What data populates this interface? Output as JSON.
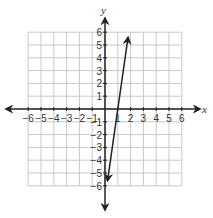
{
  "chart_data": {
    "type": "line",
    "title": "",
    "xlabel": "x",
    "ylabel": "y",
    "xlim": [
      -6,
      6
    ],
    "ylim": [
      -6,
      6
    ],
    "grid": true,
    "x_ticks": [
      "-6",
      "-5",
      "-4",
      "-3",
      "-2",
      "-1",
      "1",
      "2",
      "3",
      "4",
      "5",
      "6"
    ],
    "y_ticks": [
      "6",
      "5",
      "4",
      "3",
      "2",
      "1",
      "-1",
      "-2",
      "-3",
      "-4",
      "-5",
      "-6"
    ],
    "series": [
      {
        "name": "line",
        "equation": "y = 7x - 7",
        "x": [
          0.2,
          1.8
        ],
        "y": [
          -5.6,
          5.6
        ],
        "arrows": "both"
      }
    ],
    "colors": {
      "grid": "#c8c8c8",
      "axis": "#222222",
      "line": "#222222"
    }
  }
}
